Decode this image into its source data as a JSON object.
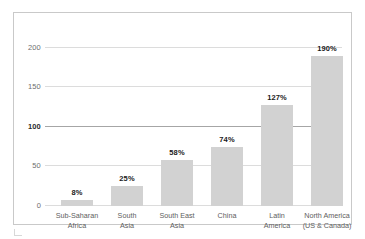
{
  "chart_data": {
    "type": "bar",
    "title": "",
    "subtitle": "",
    "xlabel": "",
    "ylabel": "",
    "ylim": [
      0,
      226
    ],
    "yticks": [
      0,
      50,
      100,
      150,
      200
    ],
    "ytick_labels": [
      "0",
      "50",
      "100",
      "150",
      "200"
    ],
    "emphasized_ytick": "100",
    "grid": true,
    "legend": "none",
    "categories": [
      "Sub-Saharan Africa",
      "South Asia",
      "South East Asia",
      "China",
      "Latin America",
      "North America (US & Canada)"
    ],
    "category_lines": [
      [
        "Sub-Saharan",
        "Africa"
      ],
      [
        "South",
        "Asia"
      ],
      [
        "South East",
        "Asia"
      ],
      [
        "China",
        ""
      ],
      [
        "Latin",
        "America"
      ],
      [
        "North America",
        "(US & Canada)"
      ]
    ],
    "values": [
      8,
      25,
      58,
      74,
      127,
      190
    ],
    "value_labels": [
      "8%",
      "25%",
      "58%",
      "74%",
      "127%",
      "190%"
    ],
    "bar_color": "#d2d2d2",
    "gridline_color": "#dcdcdc",
    "major_gridline_color": "#a6a6a6",
    "frame_color": "#c9c9c9",
    "label_color": "#5e5e5e",
    "value_label_color": "#1a1a1a"
  }
}
